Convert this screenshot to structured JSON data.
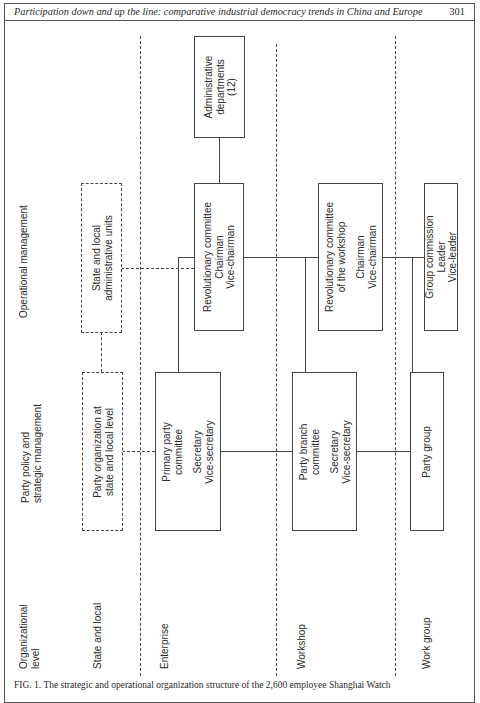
{
  "header": {
    "title": "Participation down and up the line: comparative industrial democracy trends in China and Europe",
    "page_number": "301"
  },
  "columns": {
    "operational": "Operational management",
    "party_line1": "Party policy and",
    "party_line2": "strategic management"
  },
  "levels": {
    "heading_line1": "Organizational",
    "heading_line2": "level",
    "state": "State and local",
    "enterprise": "Enterprise",
    "workshop": "Workshop",
    "work_group": "Work group"
  },
  "boxes": {
    "admin_departments": {
      "line1": "Administrative",
      "line2": "departments",
      "line3": "(12)"
    },
    "state_admin_units": {
      "line1": "State and local",
      "line2": "administrative units"
    },
    "party_org_state": {
      "line1": "Party organization at",
      "line2": "state and local level"
    },
    "revolutionary_committee": {
      "line1": "Revolutionary committee",
      "line2": "Chairman",
      "line3": "Vice-chairman"
    },
    "primary_party": {
      "line1": "Primary party",
      "line2": "committee",
      "line3": "Secretary",
      "line4": "Vice-secretary"
    },
    "rev_committee_workshop": {
      "line1": "Revolutionary committee",
      "line2": "of the workshop",
      "line3": "Chairman",
      "line4": "Vice-chairman"
    },
    "party_branch": {
      "line1": "Party branch",
      "line2": "committee",
      "line3": "Secretary",
      "line4": "Vice-secretary"
    },
    "group_commission": {
      "line1": "Group commission",
      "line2": "Leader",
      "line3": "Vice-leader"
    },
    "party_group": {
      "line1": "Party group"
    }
  },
  "caption": "FIG. 1. The strategic and operational organization structure of the 2,600 employee Shanghai Watch"
}
